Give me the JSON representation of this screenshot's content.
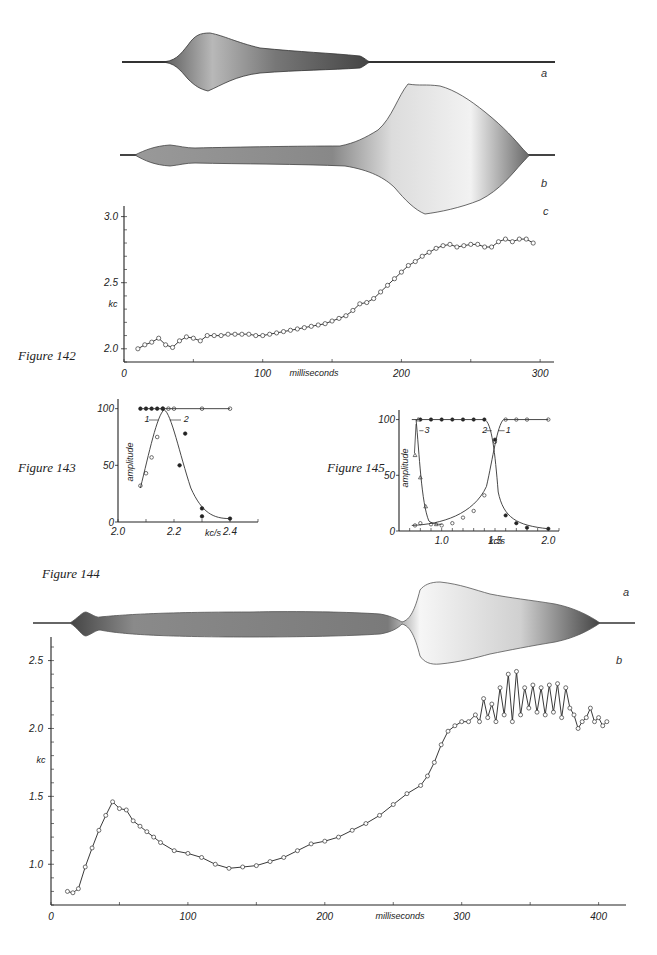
{
  "figures": {
    "fig142": {
      "label": "Figure 142",
      "panel_a": "a",
      "panel_b": "b",
      "panel_c": "c"
    },
    "fig143": {
      "label": "Figure 143"
    },
    "fig144": {
      "label": "Figure 144",
      "panel_a": "a",
      "panel_b": "b"
    },
    "fig145": {
      "label": "Figure 145"
    }
  },
  "chart_data": [
    {
      "id": "fig142c",
      "type": "line",
      "title": "Figure 142 c",
      "xlabel": "milliseconds",
      "ylabel": "kc",
      "xlim": [
        0,
        310
      ],
      "ylim": [
        1.9,
        3.05
      ],
      "xticks": [
        0,
        100,
        200,
        300
      ],
      "xtick_labels": [
        "0",
        "100",
        "200",
        "300"
      ],
      "yticks": [
        2.0,
        2.5,
        3.0
      ],
      "ytick_labels": [
        "2.0",
        "2.5",
        "3.0"
      ],
      "marker": "open-circle",
      "grid": false,
      "x": [
        10,
        15,
        20,
        25,
        30,
        35,
        40,
        45,
        50,
        55,
        60,
        65,
        70,
        75,
        80,
        85,
        90,
        95,
        100,
        105,
        110,
        115,
        120,
        125,
        130,
        135,
        140,
        145,
        150,
        155,
        160,
        165,
        170,
        175,
        180,
        185,
        190,
        195,
        200,
        205,
        210,
        215,
        220,
        225,
        230,
        235,
        240,
        245,
        250,
        255,
        260,
        265,
        270,
        275,
        280,
        285,
        290,
        295
      ],
      "values": [
        2.0,
        2.03,
        2.05,
        2.08,
        2.03,
        2.01,
        2.06,
        2.09,
        2.08,
        2.06,
        2.1,
        2.1,
        2.1,
        2.11,
        2.11,
        2.11,
        2.11,
        2.1,
        2.1,
        2.11,
        2.12,
        2.13,
        2.14,
        2.15,
        2.16,
        2.17,
        2.18,
        2.19,
        2.21,
        2.23,
        2.25,
        2.29,
        2.34,
        2.35,
        2.38,
        2.43,
        2.48,
        2.53,
        2.58,
        2.63,
        2.66,
        2.7,
        2.73,
        2.76,
        2.78,
        2.79,
        2.77,
        2.78,
        2.79,
        2.79,
        2.77,
        2.77,
        2.81,
        2.83,
        2.81,
        2.83,
        2.83,
        2.8
      ]
    },
    {
      "id": "fig143",
      "type": "scatter",
      "title": "Figure 143",
      "xlabel": "kc/s",
      "ylabel": "amplitude",
      "xlim": [
        2.0,
        2.5
      ],
      "ylim": [
        0,
        105
      ],
      "xticks": [
        2.0,
        2.2,
        2.4
      ],
      "xtick_labels": [
        "2.0",
        "2.2",
        "2.4"
      ],
      "yticks": [
        0,
        50,
        100
      ],
      "ytick_labels": [
        "0",
        "50",
        "100"
      ],
      "annotations": [
        "1",
        "2"
      ],
      "series": [
        {
          "name": "1",
          "marker": "open-circle",
          "x": [
            2.08,
            2.1,
            2.12,
            2.14,
            2.16,
            2.18,
            2.2,
            2.3,
            2.4
          ],
          "values": [
            32,
            43,
            57,
            75,
            100,
            100,
            100,
            100,
            100
          ]
        },
        {
          "name": "2",
          "marker": "filled-circle",
          "x": [
            2.08,
            2.1,
            2.12,
            2.14,
            2.16,
            2.22,
            2.24,
            2.3,
            2.3,
            2.4
          ],
          "values": [
            100,
            100,
            100,
            100,
            100,
            50,
            78,
            12,
            5,
            3
          ]
        }
      ]
    },
    {
      "id": "fig145",
      "type": "line",
      "title": "Figure 145",
      "xlabel": "kc/s",
      "ylabel": "amplitude",
      "xlim": [
        0.6,
        2.1
      ],
      "ylim": [
        0,
        105
      ],
      "xticks": [
        1.0,
        1.5,
        2.0
      ],
      "xtick_labels": [
        "1.0",
        "1.5",
        "2.0"
      ],
      "yticks": [
        0,
        50,
        100
      ],
      "ytick_labels": [
        "0",
        "50",
        "100"
      ],
      "annotations": [
        "1",
        "2",
        "3"
      ],
      "series": [
        {
          "name": "1",
          "marker": "open-circle",
          "x": [
            0.75,
            0.8,
            0.9,
            1.0,
            1.1,
            1.2,
            1.3,
            1.4,
            1.5,
            1.6,
            1.7,
            1.8,
            2.0
          ],
          "values": [
            5,
            7,
            6,
            5,
            7,
            12,
            18,
            32,
            80,
            100,
            100,
            100,
            100
          ]
        },
        {
          "name": "2",
          "marker": "filled-circle",
          "x": [
            0.8,
            0.9,
            1.0,
            1.1,
            1.2,
            1.3,
            1.4,
            1.5,
            1.6,
            1.7,
            1.8,
            2.0
          ],
          "values": [
            100,
            100,
            100,
            100,
            100,
            100,
            100,
            82,
            14,
            7,
            3,
            2
          ]
        },
        {
          "name": "3",
          "marker": "open-triangle",
          "x": [
            0.75,
            0.78,
            0.8,
            0.85,
            0.95
          ],
          "values": [
            68,
            100,
            48,
            22,
            6
          ]
        }
      ]
    },
    {
      "id": "fig144b",
      "type": "line",
      "title": "Figure 144 b",
      "xlabel": "milliseconds",
      "ylabel": "kc",
      "xlim": [
        0,
        420
      ],
      "ylim": [
        0.7,
        2.6
      ],
      "xticks": [
        0,
        100,
        200,
        300,
        400
      ],
      "xtick_labels": [
        "0",
        "100",
        "200",
        "300",
        "400"
      ],
      "yticks": [
        1.0,
        1.5,
        2.0,
        2.5
      ],
      "ytick_labels": [
        "1.0",
        "1.5",
        "2.0",
        "2.5"
      ],
      "marker": "open-circle",
      "grid": false,
      "x": [
        12,
        16,
        20,
        25,
        30,
        35,
        40,
        45,
        50,
        55,
        60,
        65,
        70,
        75,
        80,
        90,
        100,
        110,
        120,
        130,
        140,
        150,
        160,
        170,
        180,
        190,
        200,
        210,
        220,
        230,
        240,
        250,
        260,
        270,
        275,
        280,
        285,
        290,
        295,
        300,
        305,
        310,
        313,
        316,
        319,
        322,
        325,
        328,
        331,
        334,
        337,
        340,
        343,
        346,
        349,
        352,
        355,
        358,
        361,
        364,
        367,
        370,
        373,
        376,
        379,
        382,
        385,
        388,
        391,
        394,
        397,
        400,
        403,
        406
      ],
      "values": [
        0.8,
        0.79,
        0.82,
        0.98,
        1.12,
        1.25,
        1.36,
        1.46,
        1.41,
        1.4,
        1.32,
        1.28,
        1.24,
        1.2,
        1.16,
        1.1,
        1.08,
        1.05,
        1.0,
        0.97,
        0.98,
        0.99,
        1.02,
        1.05,
        1.1,
        1.15,
        1.17,
        1.2,
        1.25,
        1.3,
        1.36,
        1.44,
        1.52,
        1.58,
        1.65,
        1.75,
        1.88,
        1.98,
        2.02,
        2.05,
        2.05,
        2.1,
        2.05,
        2.22,
        2.08,
        2.18,
        2.05,
        2.3,
        2.1,
        2.4,
        2.05,
        2.42,
        2.1,
        2.3,
        2.15,
        2.32,
        2.12,
        2.3,
        2.1,
        2.32,
        2.12,
        2.33,
        2.08,
        2.3,
        2.15,
        2.1,
        2.0,
        2.05,
        2.08,
        2.15,
        2.05,
        2.08,
        2.02,
        2.05
      ]
    },
    {
      "id": "fig142ab_fig144a",
      "type": "area",
      "title": "Amplitude envelopes (oscillograms) — Figure 142 a, b and Figure 144 a",
      "note": "Sound waveform envelopes; no axes or tick labels shown."
    }
  ]
}
